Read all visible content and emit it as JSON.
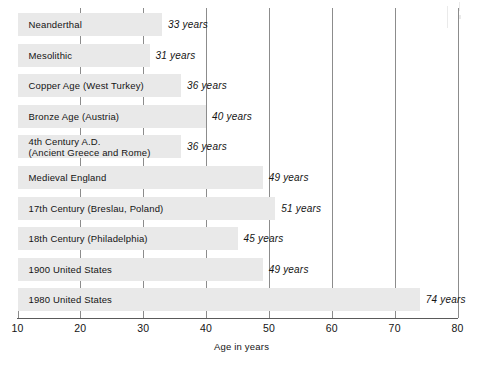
{
  "chart_data": {
    "type": "bar",
    "orientation": "horizontal",
    "title": "",
    "xlabel": "Age in years",
    "ylabel": "",
    "xlim": [
      10,
      80
    ],
    "xticks": [
      10,
      20,
      30,
      40,
      50,
      60,
      70,
      80
    ],
    "xtick_labels": [
      "10",
      "20",
      "30",
      "40",
      "50",
      "60",
      "70",
      "80"
    ],
    "grid": true,
    "grid_axis": "x",
    "legend": "none",
    "value_suffix": "years",
    "categories": [
      "Neanderthal",
      "Mesolithic",
      "Copper Age (West Turkey)",
      "Bronze Age (Austria)",
      "4th Century A.D.\n(Ancient Greece and Rome)",
      "Medieval England",
      "17th Century (Breslau, Poland)",
      "18th Century (Philadelphia)",
      "1900 United States",
      "1980 United States"
    ],
    "values": [
      33,
      31,
      36,
      40,
      36,
      49,
      51,
      45,
      49,
      74
    ],
    "value_labels": [
      "33 years",
      "31 years",
      "36 years",
      "40 years",
      "36 years",
      "49 years",
      "51 years",
      "45 years",
      "49 years",
      "74 years"
    ]
  },
  "bars": [
    {
      "label_line1": "Neanderthal",
      "label_line2": "",
      "value": 33,
      "value_label": "33 years"
    },
    {
      "label_line1": "Mesolithic",
      "label_line2": "",
      "value": 31,
      "value_label": "31 years"
    },
    {
      "label_line1": "Copper Age (West Turkey)",
      "label_line2": "",
      "value": 36,
      "value_label": "36 years"
    },
    {
      "label_line1": "Bronze Age (Austria)",
      "label_line2": "",
      "value": 40,
      "value_label": "40 years"
    },
    {
      "label_line1": "4th Century A.D.",
      "label_line2": "(Ancient Greece and Rome)",
      "value": 36,
      "value_label": "36 years"
    },
    {
      "label_line1": "Medieval England",
      "label_line2": "",
      "value": 49,
      "value_label": "49 years"
    },
    {
      "label_line1": "17th Century (Breslau, Poland)",
      "label_line2": "",
      "value": 51,
      "value_label": "51 years"
    },
    {
      "label_line1": "18th Century (Philadelphia)",
      "label_line2": "",
      "value": 45,
      "value_label": "45 years"
    },
    {
      "label_line1": "1900 United States",
      "label_line2": "",
      "value": 49,
      "value_label": "49 years"
    },
    {
      "label_line1": "1980 United States",
      "label_line2": "",
      "value": 74,
      "value_label": "74 years"
    }
  ],
  "axis": {
    "title": "Age in years",
    "ticks": [
      {
        "value": 10,
        "label": "10"
      },
      {
        "value": 20,
        "label": "20"
      },
      {
        "value": 30,
        "label": "30"
      },
      {
        "value": 40,
        "label": "40"
      },
      {
        "value": 50,
        "label": "50"
      },
      {
        "value": 60,
        "label": "60"
      },
      {
        "value": 70,
        "label": "70"
      },
      {
        "value": 80,
        "label": "80"
      }
    ]
  },
  "colors": {
    "bar_fill": "#e9e9e9",
    "gridline": "#8c8c8c",
    "axis_line": "#5a5a5a",
    "text": "#141414",
    "background": "#ffffff"
  }
}
